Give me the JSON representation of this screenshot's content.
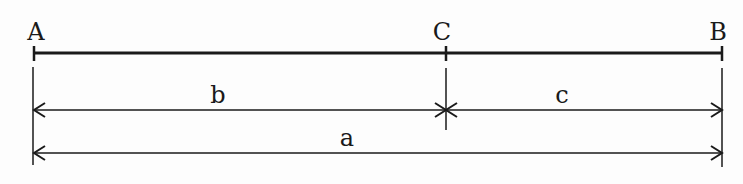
{
  "diagram": {
    "type": "line-segment-division",
    "colors": {
      "stroke": "#1a1a1a",
      "background": "#fdfdfd"
    },
    "points": [
      {
        "label": "A",
        "x": 34
      },
      {
        "label": "C",
        "x": 446
      },
      {
        "label": "B",
        "x": 722
      }
    ],
    "dimensions": [
      {
        "label": "b",
        "from": "A",
        "to": "C",
        "style": "double-arrow"
      },
      {
        "label": "c",
        "from": "C",
        "to": "B",
        "style": "double-arrow"
      },
      {
        "label": "a",
        "from": "A",
        "to": "B",
        "style": "double-arrow"
      }
    ]
  }
}
